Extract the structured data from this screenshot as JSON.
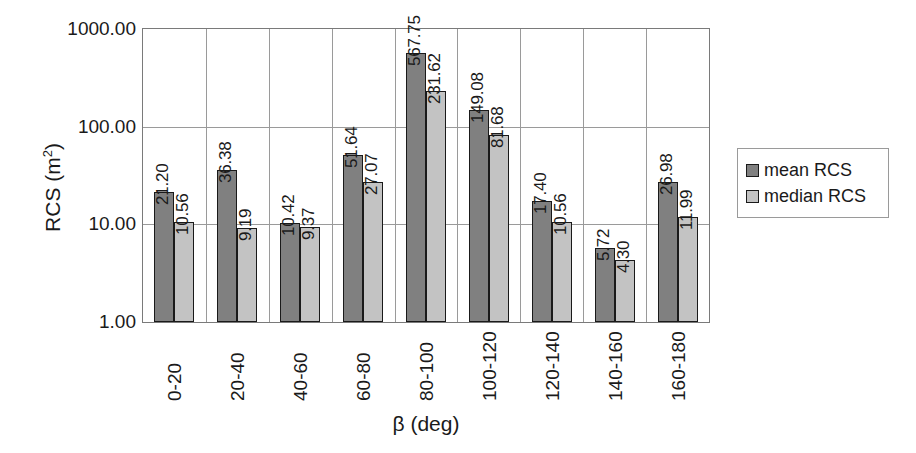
{
  "chart_data": {
    "type": "bar",
    "title": "",
    "xlabel": "β (deg)",
    "ylabel": "RCS (m²)",
    "yscale": "log",
    "ylim": [
      1,
      1000
    ],
    "ytick_labels": [
      "1.00",
      "10.00",
      "100.00",
      "1000.00"
    ],
    "ytick_values": [
      1,
      10,
      100,
      1000
    ],
    "grid": "both",
    "legend_position": "right",
    "categories": [
      "0-20",
      "20-40",
      "40-60",
      "60-80",
      "80-100",
      "100-120",
      "120-140",
      "140-160",
      "160-180"
    ],
    "series": [
      {
        "name": "mean RCS",
        "color": "#808080",
        "values": [
          21.2,
          36.38,
          10.42,
          51.64,
          567.75,
          149.08,
          17.4,
          5.72,
          26.98
        ],
        "labels": [
          "21.20",
          "36.38",
          "10.42",
          "51.64",
          "567.75",
          "149.08",
          "17.40",
          "5.72",
          "26.98"
        ]
      },
      {
        "name": "median RCS",
        "color": "#c3c3c3",
        "values": [
          10.56,
          9.19,
          9.37,
          27.07,
          231.62,
          81.68,
          10.56,
          4.3,
          11.99
        ],
        "labels": [
          "10.56",
          "9.19",
          "9.37",
          "27.07",
          "231.62",
          "81.68",
          "10.56",
          "4.30",
          "11.99"
        ]
      }
    ]
  },
  "axes": {
    "y_title": "RCS (m",
    "y_title_sup": "2",
    "y_title_close": ")",
    "x_title": "β (deg)"
  },
  "legend": {
    "entries": [
      {
        "label": "mean RCS"
      },
      {
        "label": "median RCS"
      }
    ]
  }
}
